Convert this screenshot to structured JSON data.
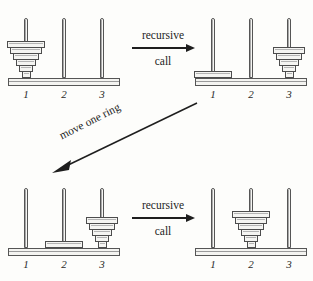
{
  "figure": {
    "ring_count": 6,
    "peg_labels": [
      "1",
      "2",
      "3"
    ],
    "colors": {
      "background": "#fdfdfb",
      "outline": "#4d4d4d",
      "ring_fill": "#f5f5f2",
      "base_fill": "#f4f4f1",
      "text": "#1e1e1e"
    }
  },
  "panels": [
    {
      "id": "top-left",
      "caption": "",
      "pegs": [
        {
          "label": "1",
          "rings": [
            6,
            5,
            4,
            3,
            2,
            1
          ]
        },
        {
          "label": "2",
          "rings": []
        },
        {
          "label": "3",
          "rings": []
        }
      ]
    },
    {
      "id": "top-right",
      "caption": "",
      "pegs": [
        {
          "label": "1",
          "rings": [
            6
          ]
        },
        {
          "label": "2",
          "rings": []
        },
        {
          "label": "3",
          "rings": [
            5,
            4,
            3,
            2,
            1
          ]
        }
      ]
    },
    {
      "id": "bottom-left",
      "caption": "",
      "pegs": [
        {
          "label": "1",
          "rings": []
        },
        {
          "label": "2",
          "rings": [
            6
          ]
        },
        {
          "label": "3",
          "rings": [
            5,
            4,
            3,
            2,
            1
          ]
        }
      ]
    },
    {
      "id": "bottom-right",
      "caption": "",
      "pegs": [
        {
          "label": "1",
          "rings": []
        },
        {
          "label": "2",
          "rings": [
            6,
            5,
            4,
            3,
            2,
            1
          ]
        },
        {
          "label": "3",
          "rings": []
        }
      ]
    }
  ],
  "arrows": {
    "top": {
      "line1": "recursive",
      "line2": "call",
      "direction": "right"
    },
    "diagonal": {
      "text": "move one ring",
      "direction": "down-left"
    },
    "bottom": {
      "line1": "recursive",
      "line2": "call",
      "direction": "right"
    }
  }
}
